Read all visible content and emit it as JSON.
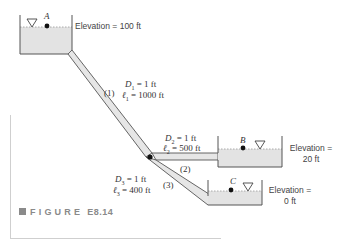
{
  "figure": {
    "caption_prefix": "FIGURE",
    "caption_number": "E8.14"
  },
  "reservoirs": [
    {
      "id": "A",
      "label": "A",
      "elevation_text": "Elevation = 100 ft"
    },
    {
      "id": "B",
      "label": "B",
      "elevation_line1": "Elevation =",
      "elevation_line2": "20 ft"
    },
    {
      "id": "C",
      "label": "C",
      "elevation_line1": "Elevation =",
      "elevation_line2": "0 ft"
    }
  ],
  "pipes": [
    {
      "id": "1",
      "tag": "(1)",
      "D": "D",
      "D_sub": "1",
      "D_val": " = 1 ft",
      "l": "ℓ",
      "l_sub": "1",
      "l_val": " = 1000 ft"
    },
    {
      "id": "2",
      "tag": "(2)",
      "D": "D",
      "D_sub": "2",
      "D_val": " = 1 ft",
      "l": "ℓ",
      "l_sub": "2",
      "l_val": " = 500 ft"
    },
    {
      "id": "3",
      "tag": "(3)",
      "D": "D",
      "D_sub": "3",
      "D_val": " = 1 ft",
      "l": "ℓ",
      "l_sub": "3",
      "l_val": " = 400 ft"
    }
  ],
  "colors": {
    "water": "#e3e3e3",
    "pipe_fill": "#e6e6e6",
    "outline": "#555555",
    "caption": "#8a8a8a"
  }
}
